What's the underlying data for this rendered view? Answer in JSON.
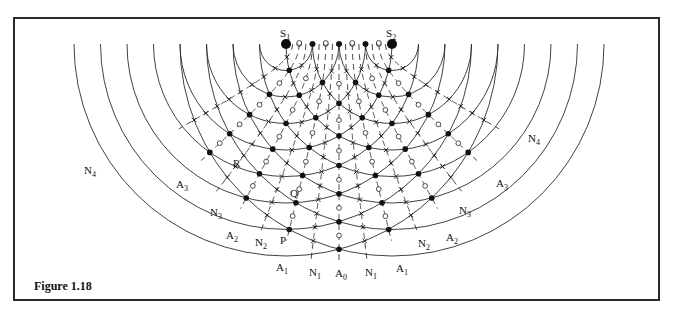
{
  "figure": {
    "caption": "Figure 1.18"
  },
  "geometry": {
    "source1": {
      "x": 286,
      "y": 44
    },
    "source2": {
      "x": 392,
      "y": 44
    },
    "wavelength": 26.5,
    "crest_count": 8,
    "colors": {
      "line": "#2b2b2b",
      "dash": "#333333",
      "frame": "#2a2a2a"
    }
  },
  "sources": [
    {
      "id": "S1",
      "letter": "S",
      "sub": "1",
      "label_x": 280,
      "label_y": 37
    },
    {
      "id": "S2",
      "letter": "S",
      "sub": "2",
      "label_x": 386,
      "label_y": 37
    }
  ],
  "antinodal_lines": [
    {
      "id": "A0",
      "order": 0
    },
    {
      "id": "A1",
      "order": 1
    },
    {
      "id": "A2",
      "order": 2
    },
    {
      "id": "A3",
      "order": 3
    }
  ],
  "nodal_lines": [
    {
      "id": "N1",
      "order": 0.5
    },
    {
      "id": "N2",
      "order": 1.5
    },
    {
      "id": "N3",
      "order": 2.5
    },
    {
      "id": "N4",
      "order": 3.5
    }
  ],
  "labels": [
    {
      "letter": "N",
      "sub": "4",
      "x": 84,
      "y": 174
    },
    {
      "letter": "N",
      "sub": "4",
      "x": 528,
      "y": 142
    },
    {
      "letter": "R",
      "sub": "",
      "x": 233,
      "y": 167
    },
    {
      "letter": "A",
      "sub": "3",
      "x": 176,
      "y": 188
    },
    {
      "letter": "A",
      "sub": "3",
      "x": 496,
      "y": 187
    },
    {
      "letter": "N",
      "sub": "3",
      "x": 210,
      "y": 216
    },
    {
      "letter": "N",
      "sub": "3",
      "x": 459,
      "y": 214
    },
    {
      "letter": "Q",
      "sub": "",
      "x": 290,
      "y": 197
    },
    {
      "letter": "A",
      "sub": "2",
      "x": 226,
      "y": 239
    },
    {
      "letter": "A",
      "sub": "2",
      "x": 446,
      "y": 241
    },
    {
      "letter": "N",
      "sub": "2",
      "x": 255,
      "y": 246
    },
    {
      "letter": "N",
      "sub": "2",
      "x": 418,
      "y": 247
    },
    {
      "letter": "P",
      "sub": "",
      "x": 280,
      "y": 244
    },
    {
      "letter": "A",
      "sub": "1",
      "x": 276,
      "y": 271
    },
    {
      "letter": "A",
      "sub": "1",
      "x": 396,
      "y": 272
    },
    {
      "letter": "N",
      "sub": "1",
      "x": 309,
      "y": 276
    },
    {
      "letter": "N",
      "sub": "1",
      "x": 365,
      "y": 276
    },
    {
      "letter": "A",
      "sub": "0",
      "x": 335,
      "y": 277
    }
  ],
  "markers_legend": {
    "filled_dot": "crest meets crest (antinode)",
    "hollow_circle": "trough meets trough (antinode)",
    "cross": "crest meets trough (node)"
  }
}
